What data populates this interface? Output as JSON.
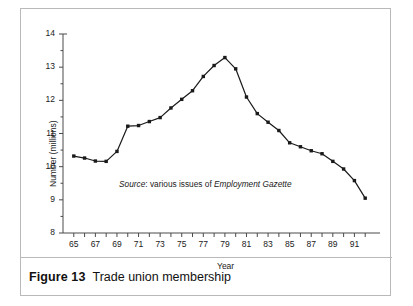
{
  "figure": {
    "caption_number": "Figure 13",
    "caption_text": "Trade union membership"
  },
  "source_note": {
    "prefix": "Source",
    "separator": ": ",
    "middle": "various issues of ",
    "publication": "Employment Gazette"
  },
  "chart_data": {
    "type": "line",
    "title": "Trade union membership",
    "xlabel": "Year",
    "ylabel": "Number (millions)",
    "xlim": [
      64,
      93
    ],
    "ylim": [
      8,
      14
    ],
    "ytick_values": [
      8,
      9,
      10,
      11,
      12,
      13,
      14
    ],
    "ytick_labels": [
      "8",
      "9",
      "10",
      "11",
      "12",
      "13",
      "14"
    ],
    "yminor_step": 0.5,
    "xtick_values": [
      65,
      66,
      67,
      68,
      69,
      70,
      71,
      72,
      73,
      74,
      75,
      76,
      77,
      78,
      79,
      80,
      81,
      82,
      83,
      84,
      85,
      86,
      87,
      88,
      89,
      90,
      91,
      92
    ],
    "xtick_labels_shown": [
      "65",
      "67",
      "69",
      "71",
      "73",
      "75",
      "77",
      "79",
      "81",
      "83",
      "85",
      "87",
      "89",
      "91"
    ],
    "grid": false,
    "legend": false,
    "marker": "square",
    "line_color": "#1a1a1a",
    "marker_color": "#1a1a1a",
    "x": [
      1965,
      1966,
      1967,
      1968,
      1969,
      1970,
      1971,
      1972,
      1973,
      1974,
      1975,
      1976,
      1977,
      1978,
      1979,
      1980,
      1981,
      1982,
      1983,
      1984,
      1985,
      1986,
      1987,
      1988,
      1989,
      1990,
      1991,
      1992
    ],
    "values": [
      10.32,
      10.26,
      10.17,
      10.16,
      10.46,
      11.22,
      11.24,
      11.36,
      11.48,
      11.77,
      12.03,
      12.29,
      12.72,
      13.05,
      13.29,
      12.95,
      12.1,
      11.6,
      11.34,
      11.09,
      10.72,
      10.6,
      10.48,
      10.39,
      10.16,
      9.93,
      9.58,
      9.05
    ],
    "ylabel_unit": "millions",
    "peak": {
      "year": 1979,
      "value": 13.29
    },
    "start": {
      "year": 1965,
      "value": 10.32
    },
    "end": {
      "year": 1992,
      "value": 9.05
    }
  }
}
